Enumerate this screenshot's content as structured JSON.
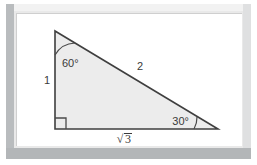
{
  "figure": {
    "kind": "geometry-diagram",
    "shape": "right-triangle",
    "frame_color": "#e9e9e9",
    "frame_shadow_color": "#b9bcbe",
    "canvas_color": "#ffffff",
    "triangle_fill": "#ececec",
    "triangle_stroke": "#3f3f3f",
    "label_color": "#3a3a3a"
  },
  "triangle": {
    "vertices": {
      "apex": {
        "x": 39,
        "y": 18
      },
      "bottom_left": {
        "x": 39,
        "y": 116
      },
      "bottom_right": {
        "x": 202,
        "y": 116
      }
    },
    "angles": [
      {
        "id": "apex-angle",
        "label": "60°",
        "vertex": "apex",
        "marker": "arc"
      },
      {
        "id": "bottom-right-angle",
        "label": "30°",
        "vertex": "bottom_right",
        "marker": "arc"
      },
      {
        "id": "bottom-left-angle",
        "label": "",
        "vertex": "bottom_left",
        "marker": "right-angle-square"
      }
    ],
    "sides": [
      {
        "id": "vertical-leg",
        "label": "1",
        "from": "apex",
        "to": "bottom_left"
      },
      {
        "id": "hypotenuse",
        "label": "2",
        "from": "apex",
        "to": "bottom_right"
      },
      {
        "id": "horizontal-leg",
        "label": "√3",
        "from": "bottom_left",
        "to": "bottom_right"
      }
    ]
  },
  "labels": {
    "angle_apex": "60°",
    "angle_bottom_right": "30°",
    "side_vertical": "1",
    "side_hypotenuse": "2",
    "side_horizontal_radical_sign": "√",
    "side_horizontal_radicand": "3",
    "side_horizontal_full": "√3"
  }
}
